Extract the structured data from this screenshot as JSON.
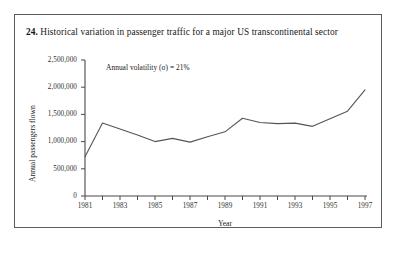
{
  "figure": {
    "number": "24.",
    "caption": "Historical variation in passenger traffic for a major US transcontinental sector"
  },
  "chart_data": {
    "type": "line",
    "title": "Historical variation in passenger traffic for a major US transcontinental sector",
    "xlabel": "Year",
    "ylabel": "Annual passengers flown",
    "annotation": "Annual volatility (σ) = 21%",
    "xlim": [
      1981,
      1997
    ],
    "ylim": [
      0,
      2500000
    ],
    "ytick_step": 500000,
    "xtick_step": 1,
    "xtick_label_step": 2,
    "grid": false,
    "legend": null,
    "line_color": "#555555",
    "x": [
      1981,
      1982,
      1983,
      1984,
      1985,
      1986,
      1987,
      1988,
      1989,
      1990,
      1991,
      1992,
      1993,
      1994,
      1995,
      1996,
      1997
    ],
    "values": [
      720000,
      1340000,
      1230000,
      1120000,
      1000000,
      1060000,
      990000,
      1090000,
      1180000,
      1430000,
      1350000,
      1330000,
      1340000,
      1280000,
      1420000,
      1560000,
      1950000
    ],
    "ytick_labels": [
      "0",
      "500,000",
      "1,000,000",
      "1,500,000",
      "2,000,000",
      "2,500,000"
    ],
    "ytick_values": [
      0,
      500000,
      1000000,
      1500000,
      2000000,
      2500000
    ],
    "xtick_labels": [
      "1981",
      "",
      "1983",
      "",
      "1985",
      "",
      "1987",
      "",
      "1989",
      "",
      "1991",
      "",
      "1993",
      "",
      "1995",
      "",
      "1997"
    ]
  }
}
